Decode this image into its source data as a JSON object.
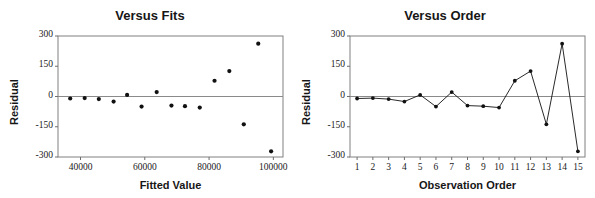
{
  "figure": {
    "panels": [
      {
        "id": "versus-fits",
        "title": "Versus Fits",
        "xlabel": "Fitted Value",
        "ylabel": "Residual"
      },
      {
        "id": "versus-order",
        "title": "Versus Order",
        "xlabel": "Observation Order",
        "ylabel": "Residual"
      }
    ]
  },
  "colors": {
    "marker": "#111111",
    "line": "#111111",
    "frame": "#808080",
    "zeroline": "#8a8a8a",
    "text": "#161616",
    "background": "#ffffff"
  },
  "chart_data": [
    {
      "type": "scatter",
      "id": "versus-fits",
      "title": "Versus Fits",
      "xlabel": "Fitted Value",
      "ylabel": "Residual",
      "xlim": [
        33000,
        103000
      ],
      "ylim": [
        -300,
        300
      ],
      "xticks": [
        40000,
        60000,
        80000,
        100000
      ],
      "xtick_labels": [
        "40000",
        "60000",
        "80000",
        "100000"
      ],
      "yticks": [
        -300,
        -150,
        0,
        150,
        300
      ],
      "ytick_labels": [
        "-300",
        "-150",
        "0",
        "150",
        "300"
      ],
      "grid": false,
      "legend": "none",
      "zero_reference_line": 0,
      "x": [
        36800,
        41300,
        45700,
        50300,
        54500,
        59000,
        63700,
        68300,
        72500,
        77100,
        81700,
        86300,
        90800,
        95300,
        99300
      ],
      "y": [
        -10,
        -8,
        -13,
        -25,
        8,
        -50,
        22,
        -45,
        -48,
        -55,
        78,
        126,
        -138,
        262,
        -272
      ]
    },
    {
      "type": "line",
      "id": "versus-order",
      "title": "Versus Order",
      "xlabel": "Observation Order",
      "ylabel": "Residual",
      "xlim": [
        0.55,
        15.45
      ],
      "ylim": [
        -300,
        300
      ],
      "xticks": [
        1,
        2,
        3,
        4,
        5,
        6,
        7,
        8,
        9,
        10,
        11,
        12,
        13,
        14,
        15
      ],
      "xtick_labels": [
        "1",
        "2",
        "3",
        "4",
        "5",
        "6",
        "7",
        "8",
        "9",
        "10",
        "11",
        "12",
        "13",
        "14",
        "15"
      ],
      "yticks": [
        -300,
        -150,
        0,
        150,
        300
      ],
      "ytick_labels": [
        "-300",
        "-150",
        "0",
        "150",
        "300"
      ],
      "grid": false,
      "legend": "none",
      "markers": true,
      "zero_reference_line": 0,
      "x": [
        1,
        2,
        3,
        4,
        5,
        6,
        7,
        8,
        9,
        10,
        11,
        12,
        13,
        14,
        15
      ],
      "y": [
        -10,
        -8,
        -13,
        -25,
        8,
        -50,
        22,
        -45,
        -48,
        -55,
        78,
        126,
        -138,
        262,
        -272
      ]
    }
  ]
}
